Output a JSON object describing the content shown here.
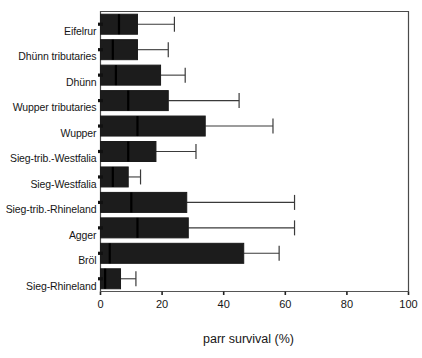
{
  "chart_data": {
    "type": "bar",
    "subtype": "horizontal-boxplot",
    "title": "",
    "xlabel": "parr survival  (%)",
    "ylabel": "",
    "xlim": [
      0,
      100
    ],
    "xticks": [
      0,
      20,
      40,
      60,
      80,
      100
    ],
    "xticklabels": [
      "0",
      "20",
      "40",
      "60",
      "80",
      "100"
    ],
    "grid": false,
    "legend": null,
    "orientation": "horizontal",
    "box_fill": "#1c1c1c",
    "line_color": "#1a1a1a",
    "categories": [
      "Eifelrur",
      "Dhünn tributaries",
      "Dhünn",
      "Wupper tributaries",
      "Wupper",
      "Sieg-trib.-Westfalia",
      "Sieg-Westfalia",
      "Sieg-trib.-Rhineland",
      "Agger",
      "Bröl",
      "Sieg-Rhineland"
    ],
    "boxes": [
      {
        "category": "Eifelrur",
        "lower_whisker": 0,
        "q1": 0,
        "median": 6.0,
        "q3": 12.0,
        "upper_whisker": 24.0
      },
      {
        "category": "Dhünn tributaries",
        "lower_whisker": 0,
        "q1": 0,
        "median": 4.0,
        "q3": 12.0,
        "upper_whisker": 22.0
      },
      {
        "category": "Dhünn",
        "lower_whisker": 0,
        "q1": 0,
        "median": 5.0,
        "q3": 19.5,
        "upper_whisker": 27.5
      },
      {
        "category": "Wupper tributaries",
        "lower_whisker": 0,
        "q1": 0,
        "median": 9.0,
        "q3": 22.0,
        "upper_whisker": 45.0
      },
      {
        "category": "Wupper",
        "lower_whisker": 0,
        "q1": 0,
        "median": 12.0,
        "q3": 34.0,
        "upper_whisker": 56.0
      },
      {
        "category": "Sieg-trib.-Westfalia",
        "lower_whisker": 0,
        "q1": 0,
        "median": 9.0,
        "q3": 18.0,
        "upper_whisker": 31.0
      },
      {
        "category": "Sieg-Westfalia",
        "lower_whisker": 0,
        "q1": 0,
        "median": 4.0,
        "q3": 9.0,
        "upper_whisker": 13.0
      },
      {
        "category": "Sieg-trib.-Rhineland",
        "lower_whisker": 0,
        "q1": 0,
        "median": 10.0,
        "q3": 28.0,
        "upper_whisker": 63.0
      },
      {
        "category": "Agger",
        "lower_whisker": 0,
        "q1": 0,
        "median": 12.0,
        "q3": 28.5,
        "upper_whisker": 63.0
      },
      {
        "category": "Bröl",
        "lower_whisker": 0,
        "q1": 0,
        "median": 3.0,
        "q3": 46.5,
        "upper_whisker": 58.0
      },
      {
        "category": "Sieg-Rhineland",
        "lower_whisker": 0,
        "q1": 0,
        "median": 1.5,
        "q3": 6.5,
        "upper_whisker": 11.5
      }
    ]
  }
}
